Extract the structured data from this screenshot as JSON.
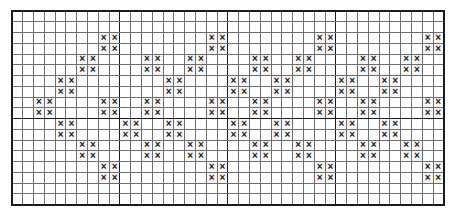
{
  "document": {
    "title": "Cross-stitch zigzag chart",
    "background_color": "#ffffff"
  },
  "chart_data": {
    "type": "heatmap",
    "title": "",
    "subtitle": "",
    "xlabel": "",
    "ylabel": "",
    "symbol": "×",
    "symbol_name": "cross-mark",
    "columns": 40,
    "rows": 18,
    "cell_size_px": 10.8,
    "grid": true,
    "grid_minor_color": "#6e6e6e",
    "grid_major_color": "#1a1a1a",
    "grid_major_every": 10,
    "border_color": "#1a1a1a",
    "fill_color": "#1a1a1a",
    "empty_color": "#fefefe",
    "legend": [],
    "annotations": [],
    "xlim": [
      0,
      40
    ],
    "ylim": [
      0,
      18
    ],
    "x_tick_labels": [],
    "y_tick_labels": [],
    "filled_cells_per_row": [
      [],
      [],
      [
        8,
        9,
        18,
        19,
        28,
        29,
        38,
        39
      ],
      [
        8,
        9,
        18,
        19,
        28,
        29,
        38,
        39
      ],
      [
        6,
        7,
        12,
        13,
        16,
        17,
        22,
        23,
        26,
        27,
        32,
        33,
        36,
        37
      ],
      [
        6,
        7,
        12,
        13,
        16,
        17,
        22,
        23,
        26,
        27,
        32,
        33,
        36,
        37
      ],
      [
        4,
        5,
        14,
        15,
        20,
        21,
        24,
        25,
        30,
        31,
        34,
        35
      ],
      [
        4,
        5,
        14,
        15,
        20,
        21,
        24,
        25,
        30,
        31,
        34,
        35
      ],
      [
        2,
        3,
        8,
        9,
        12,
        13,
        18,
        19,
        22,
        23,
        28,
        29,
        32,
        33,
        38,
        39
      ],
      [
        2,
        3,
        8,
        9,
        12,
        13,
        18,
        19,
        22,
        23,
        28,
        29,
        32,
        33,
        38,
        39
      ],
      [
        4,
        5,
        10,
        11,
        14,
        15,
        20,
        21,
        24,
        25,
        30,
        31,
        34,
        35
      ],
      [
        4,
        5,
        10,
        11,
        14,
        15,
        20,
        21,
        24,
        25,
        30,
        31,
        34,
        35
      ],
      [
        6,
        7,
        12,
        13,
        16,
        17,
        22,
        23,
        26,
        27,
        32,
        33,
        36,
        37
      ],
      [
        6,
        7,
        12,
        13,
        16,
        17,
        22,
        23,
        26,
        27,
        32,
        33,
        36,
        37
      ],
      [
        8,
        9,
        18,
        19,
        28,
        29,
        38,
        39
      ],
      [
        8,
        9,
        18,
        19,
        28,
        29,
        38,
        39
      ],
      [],
      []
    ]
  }
}
